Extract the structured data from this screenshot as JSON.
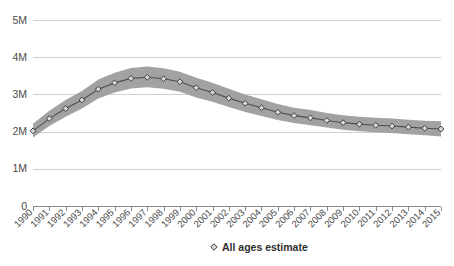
{
  "chart_data": {
    "type": "line",
    "title": "",
    "subtitle": "",
    "xlabel": "",
    "ylabel": "",
    "grid": true,
    "legend_position": "bottom",
    "xlim": [
      1990,
      2015
    ],
    "ylim": [
      0,
      5000000
    ],
    "y_ticks": [
      0,
      1000000,
      2000000,
      3000000,
      4000000,
      5000000
    ],
    "y_tick_labels": [
      "0",
      "1M",
      "2M",
      "3M",
      "4M",
      "5M"
    ],
    "categories": [
      "1990",
      "1991",
      "1992",
      "1993",
      "1994",
      "1995",
      "1996",
      "1997",
      "1998",
      "1999",
      "2000",
      "2001",
      "2002",
      "2003",
      "2004",
      "2005",
      "2006",
      "2007",
      "2008",
      "2009",
      "2010",
      "2011",
      "2012",
      "2013",
      "2014",
      "2015"
    ],
    "series": [
      {
        "name": "All ages estimate",
        "marker": "diamond",
        "values": [
          2020000,
          2350000,
          2620000,
          2850000,
          3140000,
          3310000,
          3430000,
          3460000,
          3420000,
          3340000,
          3180000,
          3050000,
          2900000,
          2760000,
          2640000,
          2520000,
          2430000,
          2370000,
          2300000,
          2240000,
          2200000,
          2170000,
          2150000,
          2120000,
          2090000,
          2070000
        ]
      }
    ],
    "uncertainty_band": {
      "name": "uncertainty interval",
      "lower": [
        1840000,
        2150000,
        2400000,
        2620000,
        2890000,
        3050000,
        3160000,
        3190000,
        3150000,
        3070000,
        2920000,
        2800000,
        2660000,
        2530000,
        2420000,
        2310000,
        2230000,
        2170000,
        2110000,
        2050000,
        2010000,
        1980000,
        1960000,
        1930000,
        1900000,
        1870000
      ],
      "upper": [
        2210000,
        2560000,
        2850000,
        3090000,
        3400000,
        3580000,
        3710000,
        3750000,
        3700000,
        3610000,
        3450000,
        3310000,
        3150000,
        3000000,
        2870000,
        2740000,
        2640000,
        2580000,
        2500000,
        2440000,
        2400000,
        2370000,
        2350000,
        2320000,
        2290000,
        2280000
      ]
    },
    "colors": {
      "band": "#9d9d9d",
      "line": "#4f4f4f",
      "marker_fill": "#d8d8d8",
      "marker_stroke": "#3f3f3f",
      "gridline": "#cfcfcf",
      "axis": "#8a8a8a",
      "text": "#4a4a4a",
      "background": "#ffffff"
    }
  },
  "legend": {
    "items": [
      {
        "label": "All ages estimate",
        "marker": "diamond"
      }
    ]
  },
  "plot_geometry": {
    "left": 33,
    "right": 441,
    "top": 20,
    "bottom": 206
  }
}
